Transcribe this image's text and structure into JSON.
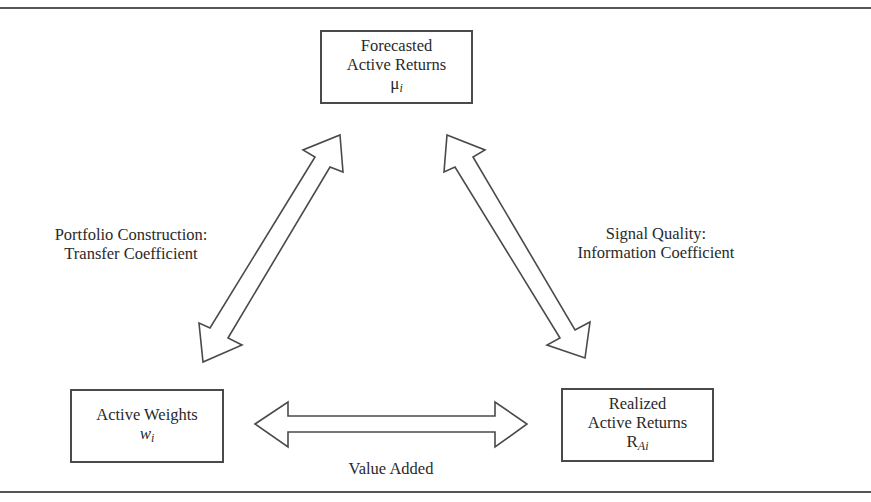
{
  "diagram": {
    "nodes": {
      "forecasted": {
        "line1": "Forecasted",
        "line2": "Active Returns",
        "symbol": "μ",
        "subscript": "i"
      },
      "weights": {
        "line1": "Active Weights",
        "symbol": "w",
        "subscript": "i"
      },
      "realized": {
        "line1": "Realized",
        "line2": "Active Returns",
        "symbol": "R",
        "subscript": "Ai"
      }
    },
    "edges": {
      "construction": {
        "line1": "Portfolio Construction:",
        "line2": "Transfer Coefficient",
        "from": "weights",
        "to": "forecasted",
        "type": "double-arrow"
      },
      "signal": {
        "line1": "Signal Quality:",
        "line2": "Information Coefficient",
        "from": "forecasted",
        "to": "realized",
        "type": "double-arrow"
      },
      "value": {
        "line1": "Value Added",
        "from": "weights",
        "to": "realized",
        "type": "double-arrow"
      }
    },
    "colors": {
      "stroke": "#4a4a4a",
      "text": "#2a2a2a",
      "background": "#ffffff"
    }
  }
}
